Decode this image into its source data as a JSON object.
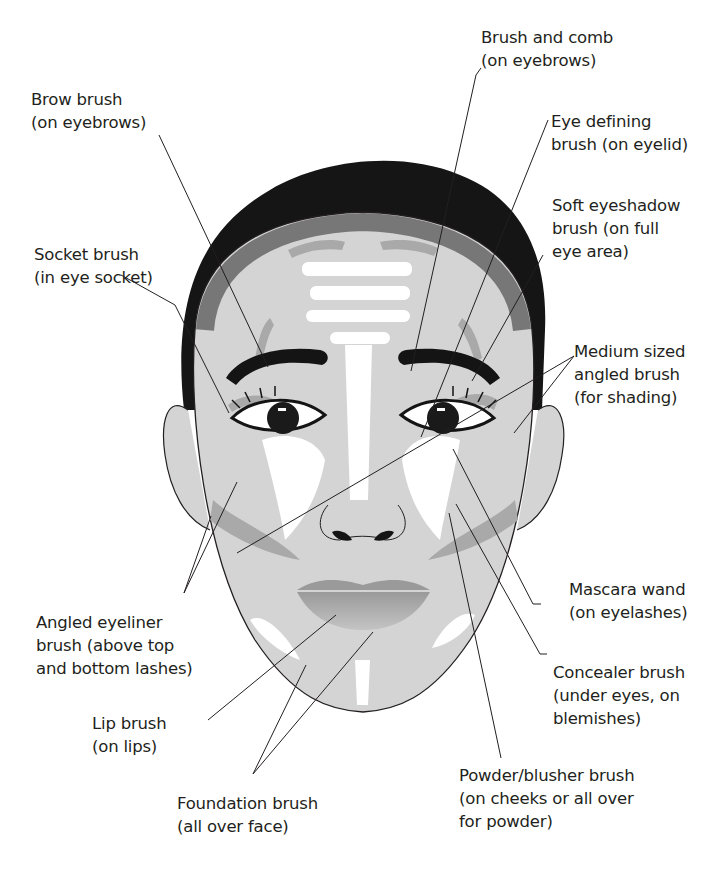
{
  "diagram": {
    "colors": {
      "hair": "#1a1a1a",
      "skin": "#d4d4d4",
      "shadow": "#a9a9a9",
      "highlight": "#ffffff",
      "line": "#231f20"
    },
    "labels": [
      {
        "id": "brush-and-comb",
        "line1": "Brush and comb",
        "line2": "(on eyebrows)",
        "line3": ""
      },
      {
        "id": "brow-brush",
        "line1": "Brow brush",
        "line2": "(on eyebrows)",
        "line3": ""
      },
      {
        "id": "eye-defining-brush",
        "line1": "Eye defining",
        "line2": "brush (on eyelid)",
        "line3": ""
      },
      {
        "id": "soft-eyeshadow-brush",
        "line1": "Soft eyeshadow",
        "line2": "brush (on full",
        "line3": "eye area)"
      },
      {
        "id": "socket-brush",
        "line1": "Socket brush",
        "line2": "(in eye socket)",
        "line3": ""
      },
      {
        "id": "medium-angled-brush",
        "line1": "Medium sized",
        "line2": "angled brush",
        "line3": "(for shading)"
      },
      {
        "id": "mascara-wand",
        "line1": "Mascara wand",
        "line2": "(on eyelashes)",
        "line3": ""
      },
      {
        "id": "angled-eyeliner-brush",
        "line1": "Angled eyeliner",
        "line2": "brush (above top",
        "line3": "and bottom lashes)"
      },
      {
        "id": "concealer-brush",
        "line1": "Concealer brush",
        "line2": "(under eyes, on",
        "line3": "blemishes)"
      },
      {
        "id": "lip-brush",
        "line1": "Lip brush",
        "line2": "(on lips)",
        "line3": ""
      },
      {
        "id": "foundation-brush",
        "line1": "Foundation brush",
        "line2": "(all over face)",
        "line3": ""
      },
      {
        "id": "powder-blusher-brush",
        "line1": "Powder/blusher brush",
        "line2": "(on cheeks or all over",
        "line3": "for powder)"
      }
    ]
  }
}
